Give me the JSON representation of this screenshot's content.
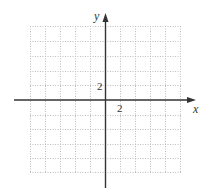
{
  "diagram": {
    "type": "coordinate-plane",
    "axes": {
      "x_label": "x",
      "y_label": "y"
    },
    "ticks": {
      "x_tick_label": "2",
      "y_tick_label": "2"
    },
    "grid": {
      "style": "dotted",
      "cells_x": 10,
      "cells_y": 10,
      "unit_per_cell": 1,
      "x_range": [
        -5,
        5
      ],
      "y_range": [
        -5,
        5
      ]
    },
    "colors": {
      "grid": "#bdbdbd",
      "axis": "#333333",
      "text": "#333333",
      "background": "#ffffff"
    }
  }
}
